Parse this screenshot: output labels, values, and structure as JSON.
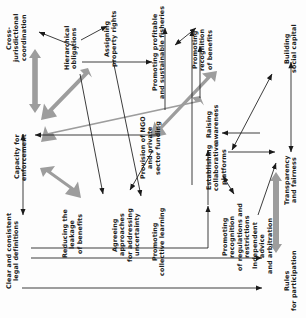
{
  "figure": {
    "type": "causal-influence-diagram",
    "orientation": "text-rotated-90-ccw",
    "background": "#fdfdfd",
    "colors": {
      "thin_arrow": "#1a1a1a",
      "thick_arrow": "#9a9a9a",
      "text": "#1b1b1b"
    }
  },
  "nodes": [
    {
      "id": "cross_jurisdictional_coordination",
      "label": "Cross-jurisdictional\ncoordination"
    },
    {
      "id": "hierarchical_obligations",
      "label": "Hierarchical\nobligations"
    },
    {
      "id": "assigning_property_rights",
      "label": "Assigning\nproperty rights"
    },
    {
      "id": "promoting_profitable_fisheries",
      "label": "Promoting profitable\nand sustainable fisheries"
    },
    {
      "id": "promoting_recognition_of_benefits",
      "label": "Promoting\nrecognition\nof benefits"
    },
    {
      "id": "building_social_capital",
      "label": "Building\nsocial capital"
    },
    {
      "id": "capacity_for_enforcement",
      "label": "Capacity for\nenforcement"
    },
    {
      "id": "provision_of_ngo_funding",
      "label": "Provision of NGO\nand private\nsector funding"
    },
    {
      "id": "establishing_collaborative_platforms",
      "label": "Establishing\ncollaborative platforms"
    },
    {
      "id": "raising_awareness",
      "label": "Raising\nawareness"
    },
    {
      "id": "transparency_and_fairness",
      "label": "Transparency\nand fairness"
    },
    {
      "id": "clear_and_consistent_legal_definitions",
      "label": "Clear and consistent\nlegal definitions"
    },
    {
      "id": "reducing_the_leakage_of_benefits",
      "label": "Reducing the leakage\nof benefits"
    },
    {
      "id": "agreeing_approaches_uncertainty",
      "label": "Agreeing approaches\nfor addressing\nuncertainty"
    },
    {
      "id": "promoting_collective_learning",
      "label": "Promoting\ncollective learning"
    },
    {
      "id": "promoting_recognition_of_regulations",
      "label": "Promoting recognition\nof regulations and\nrestrictions"
    },
    {
      "id": "independent_advice_and_arbitration",
      "label": "Independent advice\nand arbitration"
    },
    {
      "id": "rules_for_participation",
      "label": "Rules\nfor participation"
    }
  ],
  "edges": [
    {
      "from": "hierarchical_obligations",
      "to": "cross_jurisdictional_coordination",
      "weight": "thin",
      "heads": 1
    },
    {
      "from": "hierarchical_obligations",
      "to": "assigning_property_rights",
      "weight": "thin",
      "heads": 1
    },
    {
      "from": "hierarchical_obligations",
      "to": "promoting_profitable_fisheries",
      "weight": "thick",
      "heads": 1
    },
    {
      "from": "hierarchical_obligations",
      "to": "capacity_for_enforcement",
      "weight": "thick",
      "heads": 1
    },
    {
      "from": "hierarchical_obligations",
      "to": "reducing_the_leakage_of_benefits",
      "weight": "thin",
      "heads": 1
    },
    {
      "from": "hierarchical_obligations",
      "to": "agreeing_approaches_uncertainty",
      "weight": "thin",
      "heads": 1
    },
    {
      "from": "cross_jurisdictional_coordination",
      "to": "capacity_for_enforcement",
      "weight": "thick",
      "heads": 2
    },
    {
      "from": "assigning_property_rights",
      "to": "promoting_profitable_fisheries",
      "weight": "thin",
      "heads": 1
    },
    {
      "from": "promoting_profitable_fisheries",
      "to": "promoting_recognition_of_benefits",
      "weight": "thin",
      "heads": 2
    },
    {
      "from": "provision_of_ngo_funding",
      "to": "promoting_profitable_fisheries",
      "weight": "thin",
      "heads": 1
    },
    {
      "from": "provision_of_ngo_funding",
      "to": "raising_awareness",
      "weight": "thick",
      "heads": 1
    },
    {
      "from": "provision_of_ngo_funding",
      "to": "promoting_collective_learning",
      "weight": "thin",
      "heads": 1
    },
    {
      "from": "provision_of_ngo_funding",
      "to": "capacity_for_enforcement",
      "weight": "thin",
      "heads": 1
    },
    {
      "from": "raising_awareness",
      "to": "promoting_recognition_of_benefits",
      "weight": "thin",
      "heads": 1
    },
    {
      "from": "establishing_collaborative_platforms",
      "to": "building_social_capital",
      "weight": "thin",
      "heads": 2
    },
    {
      "from": "establishing_collaborative_platforms",
      "to": "promoting_recognition_of_regulations",
      "weight": "thin",
      "heads": 2
    },
    {
      "from": "building_social_capital",
      "to": "transparency_and_fairness",
      "weight": "thin",
      "heads": 2
    },
    {
      "from": "transparency_and_fairness",
      "to": "rules_for_participation",
      "weight": "thick",
      "heads": 2
    },
    {
      "from": "independent_advice_and_arbitration",
      "to": "transparency_and_fairness",
      "weight": "thin",
      "heads": 1
    },
    {
      "from": "capacity_for_enforcement",
      "to": "clear_and_consistent_legal_definitions",
      "weight": "thin",
      "heads": 2
    },
    {
      "from": "capacity_for_enforcement",
      "to": "reducing_the_leakage_of_benefits",
      "weight": "thick",
      "heads": 2
    },
    {
      "from": "promoting_collective_learning",
      "to": "establishing_collaborative_platforms",
      "weight": "thin",
      "heads": 1
    },
    {
      "from": "clear_and_consistent_legal_definitions",
      "to": "establishing_collaborative_platforms",
      "weight": "thin",
      "heads": 1
    },
    {
      "from": "rules_for_participation",
      "to": "clear_and_consistent_legal_definitions",
      "weight": "thin",
      "heads": 1
    },
    {
      "from": "capacity_for_enforcement",
      "to": "provision_of_ngo_funding",
      "weight": "thin",
      "heads": 1
    },
    {
      "from": "establishing_collaborative_platforms",
      "to": "transparency_and_fairness",
      "weight": "thin",
      "heads": 1
    }
  ]
}
